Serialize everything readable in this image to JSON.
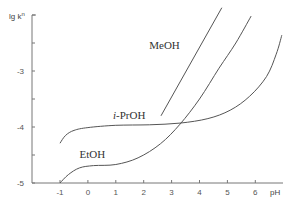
{
  "chart_data": {
    "type": "line",
    "title": "",
    "xlabel": "pH",
    "ylabel": "lg k^n",
    "ylabel_main": "lg k",
    "ylabel_sup": "n",
    "xlim": [
      -1.9,
      7.0
    ],
    "ylim": [
      -5,
      -2
    ],
    "grid": false,
    "legend": "inline labels",
    "x_ticks": [
      -1,
      0,
      1,
      2,
      3,
      4,
      5,
      6
    ],
    "x_tick_labels": [
      "-1",
      "0",
      "1",
      "2",
      "3",
      "4",
      "5",
      "6"
    ],
    "y_ticks": [
      -5,
      -4.5,
      -4,
      -3.5,
      -3,
      -2.5,
      -2
    ],
    "y_tick_labels": [
      {
        "value": -5,
        "label": "-5"
      },
      {
        "value": -4,
        "label": "-4"
      },
      {
        "value": -3,
        "label": "-3"
      }
    ],
    "series": [
      {
        "name": "MeOH",
        "label": "MeOH",
        "label_pos": [
          2.2,
          -2.6
        ],
        "points": [
          [
            2.62,
            -3.8
          ],
          [
            4.8,
            -1.87
          ]
        ]
      },
      {
        "name": "EtOH",
        "label": "EtOH",
        "label_pos": [
          -0.3,
          -4.55
        ],
        "points": [
          [
            -1.0,
            -5.0
          ],
          [
            -0.7,
            -4.85
          ],
          [
            -0.3,
            -4.73
          ],
          [
            0.2,
            -4.69
          ],
          [
            1.0,
            -4.67
          ],
          [
            1.8,
            -4.55
          ],
          [
            2.6,
            -4.3
          ],
          [
            3.3,
            -3.95
          ],
          [
            4.0,
            -3.5
          ],
          [
            4.7,
            -2.95
          ],
          [
            5.3,
            -2.5
          ],
          [
            5.85,
            -2.02
          ]
        ]
      },
      {
        "name": "i-PrOH",
        "label_italic": "i",
        "label_rest": "-PrOH",
        "label_pos": [
          0.9,
          -3.85
        ],
        "points": [
          [
            -1.0,
            -4.29
          ],
          [
            -0.8,
            -4.15
          ],
          [
            -0.5,
            -4.06
          ],
          [
            0.0,
            -4.01
          ],
          [
            1.0,
            -3.97
          ],
          [
            2.2,
            -3.96
          ],
          [
            3.3,
            -3.93
          ],
          [
            4.3,
            -3.85
          ],
          [
            5.1,
            -3.7
          ],
          [
            5.8,
            -3.45
          ],
          [
            6.4,
            -3.1
          ],
          [
            6.75,
            -2.7
          ],
          [
            6.95,
            -2.36
          ]
        ]
      }
    ]
  }
}
